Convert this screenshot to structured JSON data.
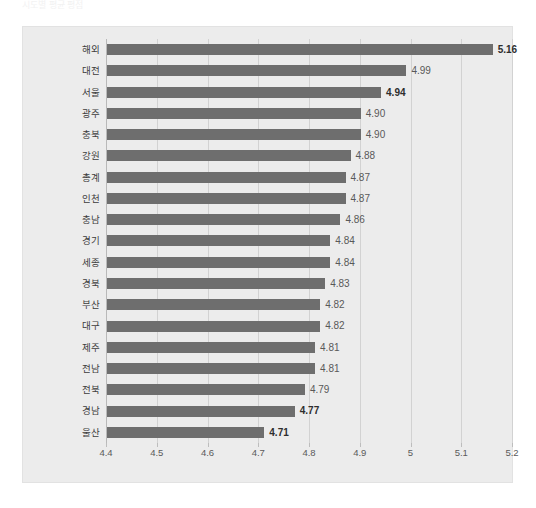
{
  "title_faint": "시도별 평균 평점",
  "chart_data": {
    "type": "bar",
    "orientation": "horizontal",
    "title": "",
    "xlabel": "",
    "ylabel": "",
    "xlim": [
      4.4,
      5.2
    ],
    "grid": true,
    "legend": "none",
    "xticks": [
      "4.4",
      "4.5",
      "4.6",
      "4.7",
      "4.8",
      "4.9",
      "5",
      "5.1",
      "5.2"
    ],
    "xtick_values": [
      4.4,
      4.5,
      4.6,
      4.7,
      4.8,
      4.9,
      5.0,
      5.1,
      5.2
    ],
    "categories": [
      "해외",
      "대전",
      "서울",
      "광주",
      "충북",
      "강원",
      "총계",
      "인천",
      "충남",
      "경기",
      "세종",
      "경북",
      "부산",
      "대구",
      "제주",
      "전남",
      "전북",
      "경남",
      "울산"
    ],
    "values": [
      5.16,
      4.99,
      4.94,
      4.9,
      4.9,
      4.88,
      4.87,
      4.87,
      4.86,
      4.84,
      4.84,
      4.83,
      4.82,
      4.82,
      4.81,
      4.81,
      4.79,
      4.77,
      4.71
    ],
    "labels": [
      "5.16",
      "4.99",
      "4.94",
      "4.90",
      "4.90",
      "4.88",
      "4.87",
      "4.87",
      "4.86",
      "4.84",
      "4.84",
      "4.83",
      "4.82",
      "4.82",
      "4.81",
      "4.81",
      "4.79",
      "4.77",
      "4.71"
    ],
    "label_emphasis": [
      true,
      false,
      true,
      false,
      false,
      false,
      false,
      false,
      false,
      false,
      false,
      false,
      false,
      false,
      false,
      false,
      false,
      true,
      true
    ],
    "bar_color": "#6e6e6e",
    "plot_background": "#ececec",
    "gridline_color": "#d2d2d2",
    "axis_color": "#b9b9b9"
  }
}
